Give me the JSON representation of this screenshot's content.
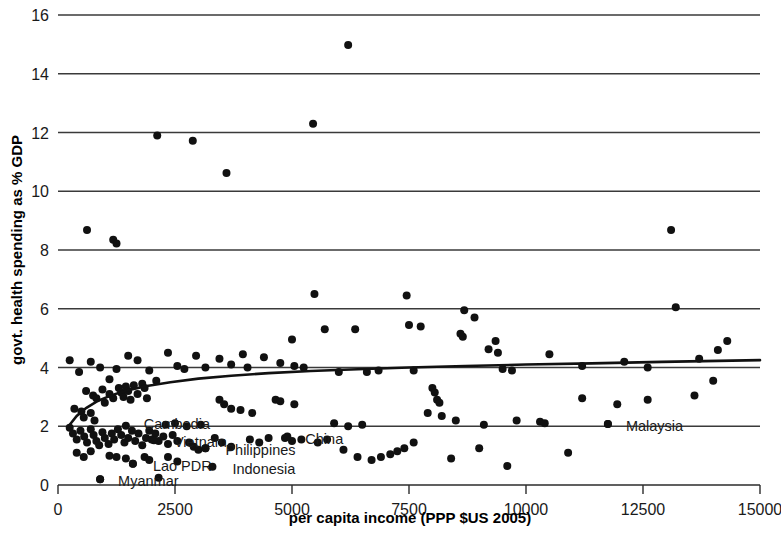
{
  "chart_data": {
    "type": "scatter",
    "title": "",
    "subtitle": "",
    "xlabel": "per capita income (PPP $US 2005)",
    "ylabel": "govt. health spending as % GDP",
    "xlim": [
      0,
      15000
    ],
    "ylim": [
      0,
      16
    ],
    "xticks": [
      0,
      2500,
      5000,
      7500,
      10000,
      12500,
      15000
    ],
    "xtick_labels": [
      "0",
      "2500",
      "5000",
      "7500",
      "10000",
      "12500",
      "15000"
    ],
    "yticks": [
      0,
      2,
      4,
      6,
      8,
      10,
      12,
      14,
      16
    ],
    "ytick_labels": [
      "0",
      "2",
      "4",
      "6",
      "8",
      "10",
      "12",
      "14",
      "16"
    ],
    "grid": "horizontal",
    "legend": "none",
    "marker_color": "#111111",
    "curve_color": "#111111",
    "curve_label": "fitted logarithmic trend",
    "curve_points": [
      [
        250,
        2.05
      ],
      [
        400,
        2.35
      ],
      [
        600,
        2.62
      ],
      [
        850,
        2.86
      ],
      [
        1150,
        3.06
      ],
      [
        1500,
        3.23
      ],
      [
        1900,
        3.37
      ],
      [
        2400,
        3.5
      ],
      [
        3000,
        3.62
      ],
      [
        3700,
        3.72
      ],
      [
        4500,
        3.81
      ],
      [
        5400,
        3.88
      ],
      [
        6400,
        3.94
      ],
      [
        7500,
        4.0
      ],
      [
        8700,
        4.05
      ],
      [
        10000,
        4.1
      ],
      [
        11400,
        4.14
      ],
      [
        12900,
        4.19
      ],
      [
        15000,
        4.25
      ]
    ],
    "annotations": [
      {
        "text": "Cambodia",
        "x": 1450,
        "y": 2.02,
        "dx": 18,
        "dy": -2
      },
      {
        "text": "Vietnam",
        "x": 2050,
        "y": 1.52,
        "dx": 20,
        "dy": 2
      },
      {
        "text": "Lao PDR",
        "x": 1600,
        "y": 0.72,
        "dx": 20,
        "dy": 2
      },
      {
        "text": "Myanmar",
        "x": 900,
        "y": 0.2,
        "dx": 18,
        "dy": 2
      },
      {
        "text": "Philippines",
        "x": 3150,
        "y": 1.25,
        "dx": 20,
        "dy": 2
      },
      {
        "text": "Indonesia",
        "x": 3300,
        "y": 0.62,
        "dx": 20,
        "dy": 2
      },
      {
        "text": "China",
        "x": 4900,
        "y": 1.65,
        "dx": 18,
        "dy": 2
      },
      {
        "text": "Malaysia",
        "x": 11750,
        "y": 2.08,
        "dx": 18,
        "dy": 2
      }
    ],
    "points": [
      [
        620,
        8.68
      ],
      [
        1180,
        8.35
      ],
      [
        1250,
        8.22
      ],
      [
        2120,
        11.9
      ],
      [
        2880,
        11.72
      ],
      [
        3600,
        10.62
      ],
      [
        5450,
        12.3
      ],
      [
        6200,
        14.98
      ],
      [
        13100,
        8.68
      ],
      [
        13200,
        6.05
      ],
      [
        5480,
        6.5
      ],
      [
        7450,
        6.45
      ],
      [
        8680,
        5.95
      ],
      [
        8900,
        5.7
      ],
      [
        7500,
        5.45
      ],
      [
        7750,
        5.4
      ],
      [
        5700,
        5.3
      ],
      [
        6350,
        5.3
      ],
      [
        8600,
        5.15
      ],
      [
        8650,
        5.05
      ],
      [
        5000,
        4.95
      ],
      [
        9350,
        4.9
      ],
      [
        9200,
        4.62
      ],
      [
        9400,
        4.5
      ],
      [
        250,
        4.25
      ],
      [
        700,
        4.2
      ],
      [
        1500,
        4.4
      ],
      [
        1700,
        4.25
      ],
      [
        2350,
        4.5
      ],
      [
        2950,
        4.4
      ],
      [
        3450,
        4.3
      ],
      [
        3950,
        4.45
      ],
      [
        4400,
        4.35
      ],
      [
        4050,
        4.0
      ],
      [
        450,
        3.85
      ],
      [
        900,
        4.0
      ],
      [
        1250,
        3.95
      ],
      [
        1100,
        3.6
      ],
      [
        1950,
        3.9
      ],
      [
        2100,
        3.55
      ],
      [
        2550,
        4.05
      ],
      [
        2700,
        3.95
      ],
      [
        3150,
        4.0
      ],
      [
        3700,
        4.1
      ],
      [
        4750,
        4.15
      ],
      [
        5050,
        4.05
      ],
      [
        5250,
        4.0
      ],
      [
        10500,
        4.45
      ],
      [
        11200,
        4.05
      ],
      [
        12100,
        4.2
      ],
      [
        12600,
        4.0
      ],
      [
        13700,
        4.3
      ],
      [
        14300,
        4.9
      ],
      [
        14100,
        4.6
      ],
      [
        14000,
        3.55
      ],
      [
        13600,
        3.05
      ],
      [
        12600,
        2.9
      ],
      [
        11950,
        2.75
      ],
      [
        11200,
        2.95
      ],
      [
        600,
        3.2
      ],
      [
        750,
        3.05
      ],
      [
        820,
        2.95
      ],
      [
        950,
        3.25
      ],
      [
        1000,
        2.8
      ],
      [
        1100,
        3.1
      ],
      [
        1180,
        2.95
      ],
      [
        1300,
        3.3
      ],
      [
        1350,
        3.15
      ],
      [
        1400,
        3.0
      ],
      [
        1450,
        3.35
      ],
      [
        1500,
        3.2
      ],
      [
        1550,
        2.9
      ],
      [
        1620,
        3.4
      ],
      [
        1700,
        3.1
      ],
      [
        1800,
        3.45
      ],
      [
        1850,
        3.3
      ],
      [
        1900,
        2.95
      ],
      [
        350,
        2.6
      ],
      [
        500,
        2.5
      ],
      [
        550,
        2.3
      ],
      [
        700,
        2.45
      ],
      [
        780,
        2.2
      ],
      [
        2300,
        2.05
      ],
      [
        2500,
        2.1
      ],
      [
        2750,
        2.0
      ],
      [
        3050,
        2.05
      ],
      [
        3450,
        2.9
      ],
      [
        3550,
        2.75
      ],
      [
        3700,
        2.6
      ],
      [
        3900,
        2.55
      ],
      [
        4150,
        2.45
      ],
      [
        4650,
        2.9
      ],
      [
        4750,
        2.85
      ],
      [
        5050,
        2.75
      ],
      [
        8000,
        3.3
      ],
      [
        8050,
        3.15
      ],
      [
        8100,
        2.9
      ],
      [
        8150,
        2.8
      ],
      [
        9500,
        3.95
      ],
      [
        9700,
        3.9
      ],
      [
        7600,
        3.9
      ],
      [
        6000,
        3.85
      ],
      [
        6600,
        3.85
      ],
      [
        6850,
        3.9
      ],
      [
        250,
        1.95
      ],
      [
        320,
        1.75
      ],
      [
        400,
        1.55
      ],
      [
        480,
        1.85
      ],
      [
        560,
        1.65
      ],
      [
        620,
        1.45
      ],
      [
        700,
        1.9
      ],
      [
        760,
        1.7
      ],
      [
        820,
        1.5
      ],
      [
        880,
        1.35
      ],
      [
        950,
        1.8
      ],
      [
        1000,
        1.6
      ],
      [
        1080,
        1.4
      ],
      [
        1150,
        1.75
      ],
      [
        1200,
        1.55
      ],
      [
        1280,
        1.9
      ],
      [
        1350,
        1.7
      ],
      [
        1420,
        1.45
      ],
      [
        1500,
        1.6
      ],
      [
        1580,
        1.85
      ],
      [
        1650,
        1.5
      ],
      [
        1720,
        1.75
      ],
      [
        1800,
        1.35
      ],
      [
        1880,
        1.6
      ],
      [
        1950,
        1.85
      ],
      [
        2000,
        1.55
      ],
      [
        2080,
        1.75
      ],
      [
        2150,
        1.5
      ],
      [
        2250,
        1.65
      ],
      [
        2350,
        1.4
      ],
      [
        2450,
        1.7
      ],
      [
        2550,
        1.5
      ],
      [
        400,
        1.1
      ],
      [
        550,
        0.95
      ],
      [
        700,
        1.15
      ],
      [
        900,
        0.2
      ],
      [
        1100,
        1.0
      ],
      [
        1250,
        0.95
      ],
      [
        1450,
        0.9
      ],
      [
        1600,
        0.72
      ],
      [
        1850,
        0.95
      ],
      [
        1950,
        0.85
      ],
      [
        2150,
        0.25
      ],
      [
        2350,
        0.95
      ],
      [
        2550,
        0.8
      ],
      [
        2800,
        1.45
      ],
      [
        2900,
        1.3
      ],
      [
        3000,
        1.2
      ],
      [
        3150,
        1.25
      ],
      [
        3350,
        1.6
      ],
      [
        3500,
        1.45
      ],
      [
        3700,
        1.3
      ],
      [
        4100,
        1.55
      ],
      [
        4300,
        1.45
      ],
      [
        4500,
        1.6
      ],
      [
        4850,
        1.6
      ],
      [
        5000,
        1.5
      ],
      [
        5200,
        1.55
      ],
      [
        5550,
        1.45
      ],
      [
        5750,
        1.55
      ],
      [
        6100,
        1.2
      ],
      [
        6400,
        0.95
      ],
      [
        6700,
        0.85
      ],
      [
        6900,
        0.95
      ],
      [
        7100,
        1.05
      ],
      [
        7250,
        1.15
      ],
      [
        7400,
        1.25
      ],
      [
        7600,
        1.45
      ],
      [
        8400,
        0.9
      ],
      [
        9000,
        1.25
      ],
      [
        9600,
        0.65
      ],
      [
        10300,
        2.15
      ],
      [
        10400,
        2.1
      ],
      [
        11750,
        2.08
      ],
      [
        10900,
        1.1
      ],
      [
        5900,
        2.1
      ],
      [
        6200,
        2.0
      ],
      [
        6500,
        2.05
      ],
      [
        7900,
        2.45
      ],
      [
        8200,
        2.35
      ],
      [
        8500,
        2.2
      ],
      [
        9100,
        2.05
      ],
      [
        9800,
        2.2
      ]
    ]
  },
  "figure": {
    "background_color": "#ffffff"
  }
}
